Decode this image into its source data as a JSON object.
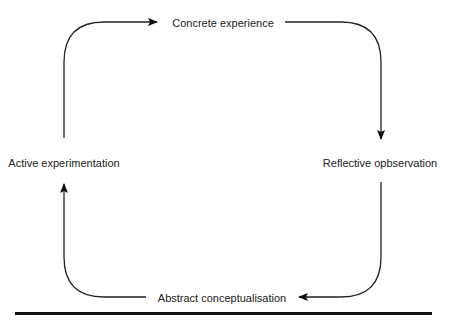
{
  "diagram": {
    "type": "cycle",
    "direction": "clockwise",
    "colors": {
      "line": "#222222",
      "text": "#222222",
      "rule": "#111111",
      "background": "#ffffff"
    },
    "nodes": [
      {
        "id": "top",
        "label": "Concrete experience"
      },
      {
        "id": "right",
        "label": "Reflective opbservation"
      },
      {
        "id": "bottom",
        "label": "Abstract conceptualisation"
      },
      {
        "id": "left",
        "label": "Active experimentation"
      }
    ],
    "edges": [
      {
        "from": "left",
        "to": "top",
        "icon": "curved-arrow-icon"
      },
      {
        "from": "top",
        "to": "right",
        "icon": "curved-arrow-icon"
      },
      {
        "from": "right",
        "to": "bottom",
        "icon": "curved-arrow-icon"
      },
      {
        "from": "bottom",
        "to": "left",
        "icon": "curved-arrow-icon"
      }
    ]
  }
}
